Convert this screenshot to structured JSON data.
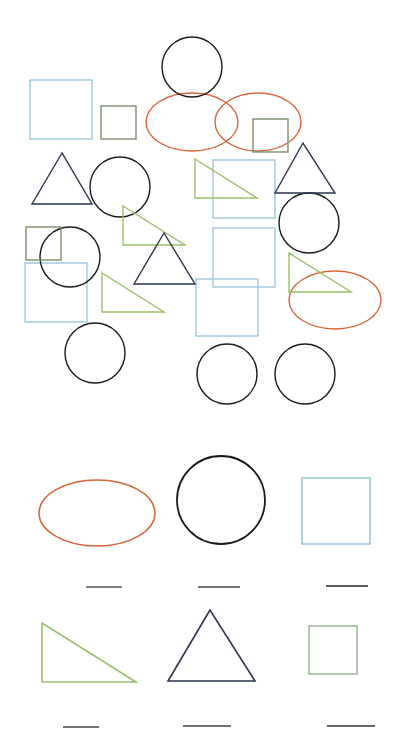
{
  "worksheet": {
    "title": "Count the shapes",
    "colors": {
      "circle": "#1a1a1a",
      "ellipse": "#d9643a",
      "square_blue": "#9cc7dc",
      "square_green": "#7a8f6a",
      "triangle_green": "#9ac26a",
      "triangle_navy": "#2a3550",
      "answer_line": "#444444"
    },
    "scene": {
      "circles": [
        {
          "cx": 192,
          "cy": 67,
          "r": 30
        },
        {
          "cx": 120,
          "cy": 187,
          "r": 30
        },
        {
          "cx": 70,
          "cy": 257,
          "r": 30
        },
        {
          "cx": 309,
          "cy": 223,
          "r": 30
        },
        {
          "cx": 95,
          "cy": 353,
          "r": 30
        },
        {
          "cx": 227,
          "cy": 374,
          "r": 30
        },
        {
          "cx": 305,
          "cy": 374,
          "r": 30
        }
      ],
      "ellipses": [
        {
          "cx": 258,
          "cy": 122,
          "rx": 43,
          "ry": 29
        },
        {
          "cx": 192,
          "cy": 122,
          "rx": 46,
          "ry": 29
        },
        {
          "cx": 335,
          "cy": 300,
          "rx": 46,
          "ry": 29
        }
      ],
      "blue_squares": [
        {
          "x": 30,
          "y": 80,
          "w": 62,
          "h": 59
        },
        {
          "x": 213,
          "y": 160,
          "w": 62,
          "h": 58
        },
        {
          "x": 213,
          "y": 228,
          "w": 62,
          "h": 59
        },
        {
          "x": 196,
          "y": 279,
          "w": 62,
          "h": 57
        },
        {
          "x": 25,
          "y": 263,
          "w": 62,
          "h": 59
        }
      ],
      "green_squares": [
        {
          "x": 101,
          "y": 106,
          "w": 35,
          "h": 33
        },
        {
          "x": 253,
          "y": 119,
          "w": 35,
          "h": 33
        },
        {
          "x": 26,
          "y": 227,
          "w": 35,
          "h": 33
        }
      ],
      "green_triangles": [
        {
          "points": "195,159 195,198 257,198"
        },
        {
          "points": "123,206 123,245 185,245"
        },
        {
          "points": "102,273 102,312 164,312"
        },
        {
          "points": "289,253 289,292 351,292"
        }
      ],
      "navy_triangles": [
        {
          "points": "62,153 32,204 92,204"
        },
        {
          "points": "303,143 275,193 335,193"
        },
        {
          "points": "164,233 134,284 195,284"
        }
      ]
    },
    "answer_key": [
      {
        "shape": "ellipse",
        "blank": "____"
      },
      {
        "shape": "circle",
        "blank": "____"
      },
      {
        "shape": "blue-square",
        "blank": "____"
      },
      {
        "shape": "right-triangle",
        "blank": "____"
      },
      {
        "shape": "equilateral-triangle",
        "blank": "____"
      },
      {
        "shape": "green-square",
        "blank": "____"
      }
    ]
  }
}
